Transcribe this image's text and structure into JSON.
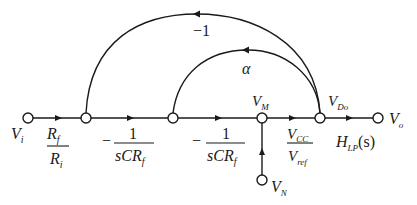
{
  "diagram": {
    "type": "signal-flow-graph",
    "nodes": {
      "vi": {
        "label": "V",
        "sub": "i"
      },
      "n2": {},
      "n3": {},
      "vm": {
        "label": "V",
        "sub": "M"
      },
      "vdo": {
        "label": "V",
        "sub": "Do"
      },
      "vo": {
        "label": "V",
        "sub": "o"
      },
      "vn": {
        "label": "V",
        "sub": "N"
      }
    },
    "branches": {
      "gain1": {
        "num": "R",
        "num_sub": "f",
        "den": "R",
        "den_sub": "i"
      },
      "gain2": {
        "sign": "−",
        "num": "1",
        "den": "sCR",
        "den_sub": "f"
      },
      "gain3": {
        "sign": "−",
        "num": "1",
        "den": "sCR",
        "den_sub": "f"
      },
      "gain4": {
        "num": "V",
        "num_sub": "CC",
        "den": "V",
        "den_sub": "ref"
      },
      "gain5": {
        "main": "H",
        "sub": "LP",
        "tail": "(s)"
      },
      "feedback_outer": {
        "label": "−1"
      },
      "feedback_inner": {
        "label": "α"
      }
    }
  }
}
